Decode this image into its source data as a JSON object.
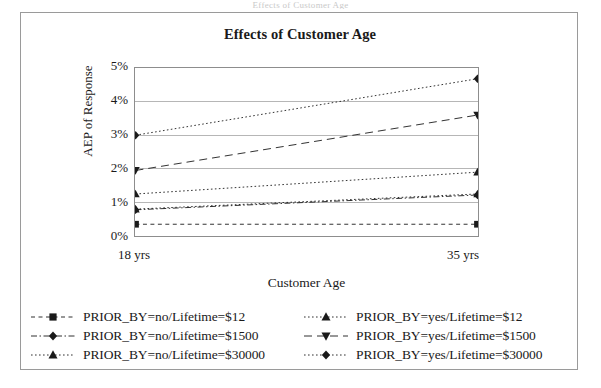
{
  "page_bleed_text": "Effects of Customer Age",
  "chart_data": {
    "type": "line",
    "title": "Effects of Customer Age",
    "xlabel": "Customer Age",
    "ylabel": "AEP of Response",
    "categories": [
      "18 yrs",
      "35 yrs"
    ],
    "x_tick_labels": [
      "18 yrs",
      "35 yrs"
    ],
    "y_tick_labels": [
      "0%",
      "1%",
      "2%",
      "3%",
      "4%",
      "5%"
    ],
    "y_tick_values": [
      0,
      1,
      2,
      3,
      4,
      5
    ],
    "ylim": [
      0,
      5
    ],
    "y_unit": "%",
    "grid": "horizontal",
    "legend_position": "bottom",
    "legend_columns": 2,
    "series": [
      {
        "name": "PRIOR_BY=no/Lifetime=$12",
        "marker": "square",
        "line_style": "dashed",
        "values": [
          0.35,
          0.35
        ]
      },
      {
        "name": "PRIOR_BY=no/Lifetime=$1500",
        "marker": "diamond",
        "line_style": "dash-dot",
        "values": [
          0.78,
          1.22
        ]
      },
      {
        "name": "PRIOR_BY=no/Lifetime=$30000",
        "marker": "triangle-up",
        "line_style": "dotted",
        "values": [
          1.25,
          1.9
        ]
      },
      {
        "name": "PRIOR_BY=yes/Lifetime=$12",
        "marker": "triangle-up",
        "line_style": "dotted",
        "values": [
          0.8,
          1.25
        ]
      },
      {
        "name": "PRIOR_BY=yes/Lifetime=$1500",
        "marker": "triangle-down",
        "line_style": "long-dash",
        "values": [
          1.95,
          3.6
        ]
      },
      {
        "name": "PRIOR_BY=yes/Lifetime=$30000",
        "marker": "diamond",
        "line_style": "dotted",
        "values": [
          3.0,
          4.68
        ]
      }
    ]
  },
  "legend": {
    "items": [
      {
        "label": "PRIOR_BY=no/Lifetime=$12"
      },
      {
        "label": "PRIOR_BY=yes/Lifetime=$12"
      },
      {
        "label": "PRIOR_BY=no/Lifetime=$1500"
      },
      {
        "label": "PRIOR_BY=yes/Lifetime=$1500"
      },
      {
        "label": "PRIOR_BY=no/Lifetime=$30000"
      },
      {
        "label": "PRIOR_BY=yes/Lifetime=$30000"
      }
    ]
  },
  "colors": {
    "ink": "#1a1a1a",
    "frame": "#9a9a9a",
    "grid": "#b5b5b5"
  }
}
